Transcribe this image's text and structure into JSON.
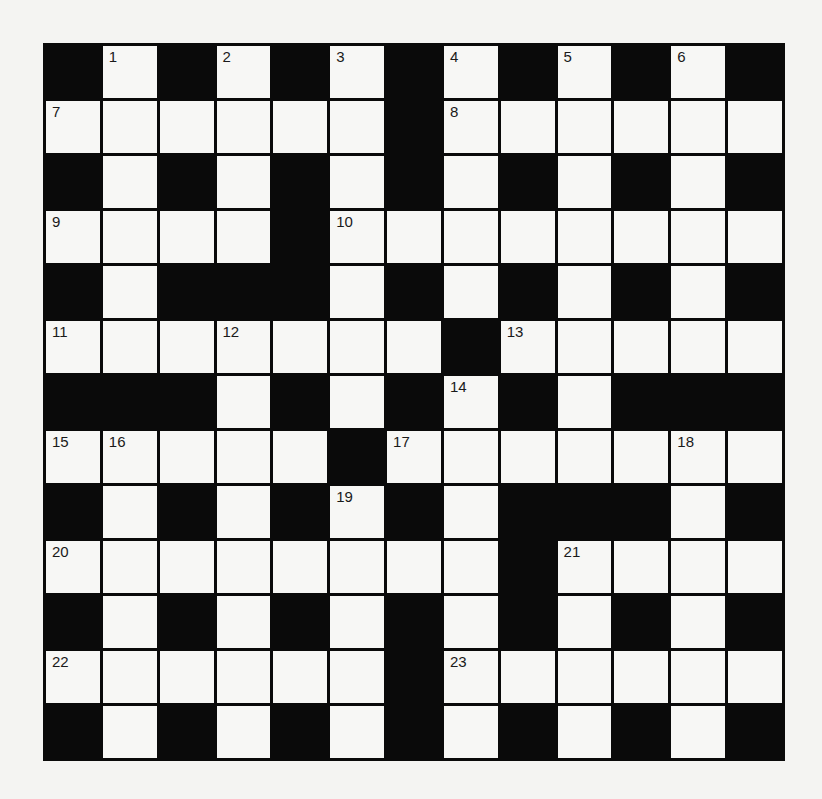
{
  "puzzle": {
    "rows": 13,
    "cols": 13,
    "colors": {
      "background": "#f4f4f2",
      "white_cell": "#f7f7f5",
      "black_cell": "#0a0a0a",
      "number_text": "#1a1a1a"
    },
    "grid": [
      "#.#.#.#.#.#.#",
      "......#......",
      "#.#.#.#.#.#.#",
      "....#........",
      "#.###.#.#.#.#",
      ".......#.....",
      "###.#.#.#.###",
      ".....#.......",
      "#.#.#.#.###.#",
      "........#....",
      "#.#.#.#.#.#.#",
      "......#......",
      "#.#.#.#.#.#.#"
    ],
    "numbers": [
      {
        "row": 0,
        "col": 1,
        "n": "1"
      },
      {
        "row": 0,
        "col": 3,
        "n": "2"
      },
      {
        "row": 0,
        "col": 5,
        "n": "3"
      },
      {
        "row": 0,
        "col": 7,
        "n": "4"
      },
      {
        "row": 0,
        "col": 9,
        "n": "5"
      },
      {
        "row": 0,
        "col": 11,
        "n": "6"
      },
      {
        "row": 1,
        "col": 0,
        "n": "7"
      },
      {
        "row": 1,
        "col": 7,
        "n": "8"
      },
      {
        "row": 3,
        "col": 0,
        "n": "9"
      },
      {
        "row": 3,
        "col": 5,
        "n": "10"
      },
      {
        "row": 5,
        "col": 0,
        "n": "11"
      },
      {
        "row": 5,
        "col": 3,
        "n": "12"
      },
      {
        "row": 5,
        "col": 8,
        "n": "13"
      },
      {
        "row": 6,
        "col": 7,
        "n": "14"
      },
      {
        "row": 7,
        "col": 0,
        "n": "15"
      },
      {
        "row": 7,
        "col": 1,
        "n": "16"
      },
      {
        "row": 7,
        "col": 6,
        "n": "17"
      },
      {
        "row": 7,
        "col": 11,
        "n": "18"
      },
      {
        "row": 8,
        "col": 5,
        "n": "19"
      },
      {
        "row": 9,
        "col": 0,
        "n": "20"
      },
      {
        "row": 9,
        "col": 9,
        "n": "21"
      },
      {
        "row": 11,
        "col": 0,
        "n": "22"
      },
      {
        "row": 11,
        "col": 7,
        "n": "23"
      }
    ]
  }
}
